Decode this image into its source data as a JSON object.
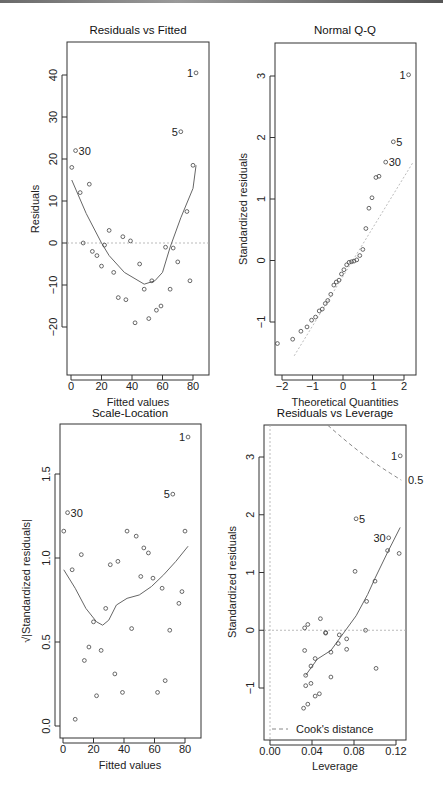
{
  "chart_data": [
    {
      "type": "scatter",
      "title": "Residuals vs Fitted",
      "xlabel": "Fitted values",
      "ylabel": "Residuals",
      "xlim": [
        -2,
        86
      ],
      "ylim": [
        -26,
        48
      ],
      "xticks": [
        0,
        20,
        40,
        60,
        80
      ],
      "yticks": [
        -20,
        -10,
        0,
        10,
        20,
        30,
        40
      ],
      "reference_line": {
        "y": 0,
        "style": "dotted"
      },
      "points": [
        {
          "x": 0.5,
          "y": 18
        },
        {
          "x": 3,
          "y": 22,
          "label": "30"
        },
        {
          "x": 6,
          "y": 12
        },
        {
          "x": 8,
          "y": 0
        },
        {
          "x": 12,
          "y": 14
        },
        {
          "x": 14,
          "y": -2
        },
        {
          "x": 17,
          "y": -3
        },
        {
          "x": 20,
          "y": -5.5
        },
        {
          "x": 22,
          "y": -0.5
        },
        {
          "x": 25,
          "y": 3
        },
        {
          "x": 28,
          "y": -7
        },
        {
          "x": 31,
          "y": -13
        },
        {
          "x": 34,
          "y": 1.5
        },
        {
          "x": 36,
          "y": -13.5
        },
        {
          "x": 39,
          "y": 0.5
        },
        {
          "x": 42,
          "y": -19
        },
        {
          "x": 45,
          "y": -5
        },
        {
          "x": 48,
          "y": -11
        },
        {
          "x": 51,
          "y": -18
        },
        {
          "x": 53,
          "y": -9
        },
        {
          "x": 56,
          "y": -16
        },
        {
          "x": 59,
          "y": -15
        },
        {
          "x": 62,
          "y": -1
        },
        {
          "x": 65,
          "y": -11
        },
        {
          "x": 67,
          "y": -1.2
        },
        {
          "x": 70,
          "y": -4.5
        },
        {
          "x": 72,
          "y": 26.5,
          "label": "5"
        },
        {
          "x": 76,
          "y": 7.5
        },
        {
          "x": 78,
          "y": -9
        },
        {
          "x": 80,
          "y": 18.5
        },
        {
          "x": 82,
          "y": 40.5,
          "label": "1"
        }
      ],
      "smooth": [
        [
          0.5,
          15
        ],
        [
          10,
          7
        ],
        [
          20,
          0
        ],
        [
          25,
          -3
        ],
        [
          35,
          -7
        ],
        [
          48,
          -9.8
        ],
        [
          55,
          -9
        ],
        [
          60,
          -7
        ],
        [
          65,
          -1
        ],
        [
          72,
          6
        ],
        [
          80,
          13
        ],
        [
          82,
          18.5
        ]
      ]
    },
    {
      "type": "scatter",
      "title": "Normal Q-Q",
      "xlabel": "Theoretical Quantities",
      "ylabel": "Standardized residuals",
      "xlim": [
        -2.3,
        2.3
      ],
      "ylim": [
        -1.55,
        3.5
      ],
      "xticks": [
        -2,
        -1,
        0,
        1,
        2
      ],
      "yticks": [
        -1,
        0,
        1,
        2,
        3
      ],
      "reference_line": {
        "from": [
          -1.6,
          -1.55
        ],
        "to": [
          2.3,
          1.6
        ],
        "style": "dotted"
      },
      "points": [
        {
          "x": -2.15,
          "y": -1.35
        },
        {
          "x": -1.65,
          "y": -1.28
        },
        {
          "x": -1.38,
          "y": -1.15
        },
        {
          "x": -1.18,
          "y": -1.08
        },
        {
          "x": -1.03,
          "y": -0.97
        },
        {
          "x": -0.9,
          "y": -0.92
        },
        {
          "x": -0.78,
          "y": -0.82
        },
        {
          "x": -0.68,
          "y": -0.79
        },
        {
          "x": -0.58,
          "y": -0.7
        },
        {
          "x": -0.5,
          "y": -0.65
        },
        {
          "x": -0.4,
          "y": -0.55
        },
        {
          "x": -0.3,
          "y": -0.4
        },
        {
          "x": -0.22,
          "y": -0.35
        },
        {
          "x": -0.13,
          "y": -0.32
        },
        {
          "x": -0.05,
          "y": -0.22
        },
        {
          "x": 0.03,
          "y": -0.15
        },
        {
          "x": 0.12,
          "y": -0.07
        },
        {
          "x": 0.2,
          "y": -0.03
        },
        {
          "x": 0.28,
          "y": -0.02
        },
        {
          "x": 0.36,
          "y": -0.01
        },
        {
          "x": 0.45,
          "y": 0.01
        },
        {
          "x": 0.55,
          "y": 0.08
        },
        {
          "x": 0.65,
          "y": 0.18
        },
        {
          "x": 0.75,
          "y": 0.52
        },
        {
          "x": 0.85,
          "y": 0.85
        },
        {
          "x": 0.95,
          "y": 1.02
        },
        {
          "x": 1.08,
          "y": 1.35
        },
        {
          "x": 1.18,
          "y": 1.37
        },
        {
          "x": 1.4,
          "y": 1.6,
          "label": "30"
        },
        {
          "x": 1.65,
          "y": 1.93,
          "label": "5"
        },
        {
          "x": 2.15,
          "y": 3.02,
          "label": "1"
        }
      ]
    },
    {
      "type": "scatter",
      "title": "Scale-Location",
      "xlabel": "Fitted values",
      "ylabel": "√|Standardized residuals|",
      "xlim": [
        -2,
        86
      ],
      "ylim": [
        -0.07,
        1.8
      ],
      "xticks": [
        0,
        20,
        40,
        60,
        80
      ],
      "yticks": [
        0.0,
        0.5,
        1.0,
        1.5
      ],
      "points": [
        {
          "x": 0.5,
          "y": 1.16
        },
        {
          "x": 3,
          "y": 1.27,
          "label": "30"
        },
        {
          "x": 6,
          "y": 0.93
        },
        {
          "x": 8,
          "y": 0.04
        },
        {
          "x": 12,
          "y": 1.02
        },
        {
          "x": 14,
          "y": 0.39
        },
        {
          "x": 17,
          "y": 0.47
        },
        {
          "x": 20,
          "y": 0.62
        },
        {
          "x": 22,
          "y": 0.18
        },
        {
          "x": 25,
          "y": 0.45
        },
        {
          "x": 28,
          "y": 0.7
        },
        {
          "x": 31,
          "y": 0.96
        },
        {
          "x": 34,
          "y": 0.31
        },
        {
          "x": 36,
          "y": 0.98
        },
        {
          "x": 39,
          "y": 0.2
        },
        {
          "x": 42,
          "y": 1.16
        },
        {
          "x": 45,
          "y": 0.58
        },
        {
          "x": 48,
          "y": 1.13
        },
        {
          "x": 51,
          "y": 0.89
        },
        {
          "x": 53,
          "y": 1.06
        },
        {
          "x": 56,
          "y": 1.03
        },
        {
          "x": 59,
          "y": 0.88
        },
        {
          "x": 62,
          "y": 0.2
        },
        {
          "x": 65,
          "y": 0.82
        },
        {
          "x": 67,
          "y": 0.27
        },
        {
          "x": 70,
          "y": 0.57
        },
        {
          "x": 72,
          "y": 1.38,
          "label": "5"
        },
        {
          "x": 76,
          "y": 0.73
        },
        {
          "x": 78,
          "y": 0.8
        },
        {
          "x": 80,
          "y": 1.16
        },
        {
          "x": 82,
          "y": 1.72,
          "label": "1"
        }
      ],
      "smooth": [
        [
          0.5,
          0.93
        ],
        [
          8,
          0.82
        ],
        [
          15,
          0.7
        ],
        [
          22,
          0.62
        ],
        [
          26,
          0.6
        ],
        [
          30,
          0.63
        ],
        [
          35,
          0.72
        ],
        [
          42,
          0.76
        ],
        [
          50,
          0.78
        ],
        [
          58,
          0.83
        ],
        [
          66,
          0.9
        ],
        [
          74,
          0.98
        ],
        [
          82,
          1.07
        ]
      ]
    },
    {
      "type": "scatter",
      "title": "Residuals vs Leverage",
      "xlabel": "Leverage",
      "ylabel": "Standardized residuals",
      "xlim": [
        -0.005,
        0.13
      ],
      "ylim": [
        -1.9,
        3.55
      ],
      "xticks": [
        0.0,
        0.04,
        0.08,
        0.12
      ],
      "yticks": [
        -1,
        0,
        1,
        2,
        3
      ],
      "reference_line": {
        "y": 0,
        "style": "dotted"
      },
      "cooks_distance": {
        "level": 0.5,
        "label": "0.5"
      },
      "legend": {
        "label": "Cook's distance",
        "position": "bottom-left"
      },
      "points": [
        {
          "x": 0.032,
          "y": -1.35
        },
        {
          "x": 0.033,
          "y": 0.04
        },
        {
          "x": 0.033,
          "y": -0.35
        },
        {
          "x": 0.034,
          "y": -0.78
        },
        {
          "x": 0.034,
          "y": -0.96
        },
        {
          "x": 0.036,
          "y": 0.1
        },
        {
          "x": 0.036,
          "y": -1.28
        },
        {
          "x": 0.039,
          "y": -0.62
        },
        {
          "x": 0.039,
          "y": -0.92
        },
        {
          "x": 0.043,
          "y": -0.49
        },
        {
          "x": 0.043,
          "y": -1.14
        },
        {
          "x": 0.047,
          "y": -1.1
        },
        {
          "x": 0.048,
          "y": 0.2
        },
        {
          "x": 0.053,
          "y": -0.04
        },
        {
          "x": 0.053,
          "y": -0.05
        },
        {
          "x": 0.058,
          "y": -0.38
        },
        {
          "x": 0.058,
          "y": -0.81
        },
        {
          "x": 0.065,
          "y": -0.23
        },
        {
          "x": 0.066,
          "y": -0.08
        },
        {
          "x": 0.073,
          "y": -0.15
        },
        {
          "x": 0.073,
          "y": -0.33
        },
        {
          "x": 0.081,
          "y": 1.02
        },
        {
          "x": 0.082,
          "y": 1.93,
          "label": "5"
        },
        {
          "x": 0.091,
          "y": 0.0
        },
        {
          "x": 0.092,
          "y": 0.5
        },
        {
          "x": 0.1,
          "y": 0.85
        },
        {
          "x": 0.101,
          "y": -0.66
        },
        {
          "x": 0.112,
          "y": 1.38
        },
        {
          "x": 0.113,
          "y": 1.6,
          "label": "30"
        },
        {
          "x": 0.123,
          "y": 1.33
        },
        {
          "x": 0.124,
          "y": 3.02,
          "label": "1"
        }
      ],
      "smooth": [
        [
          0.034,
          -0.78
        ],
        [
          0.045,
          -0.5
        ],
        [
          0.058,
          -0.35
        ],
        [
          0.068,
          -0.1
        ],
        [
          0.082,
          0.25
        ],
        [
          0.093,
          0.62
        ],
        [
          0.1,
          0.9
        ],
        [
          0.112,
          1.35
        ],
        [
          0.124,
          1.78
        ]
      ]
    }
  ]
}
